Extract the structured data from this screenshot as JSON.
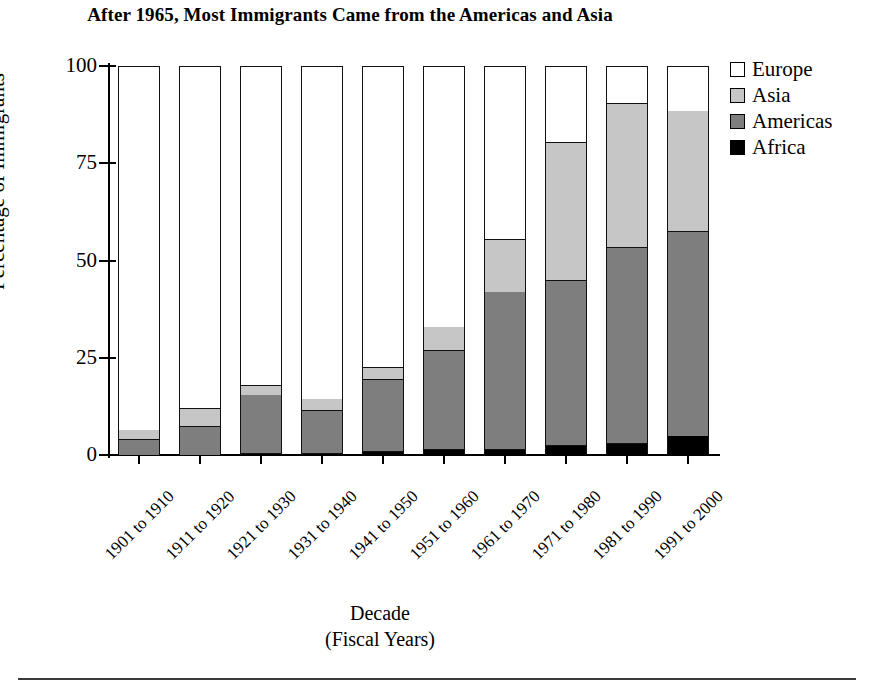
{
  "title": "After 1965, Most Immigrants Came from the Americas and Asia",
  "axis": {
    "ylabel": "Percentage of Immigrants",
    "xlabel_line1": "Decade",
    "xlabel_line2": "(Fiscal Years)",
    "yticks": [
      "100",
      "75",
      "50",
      "25",
      "0"
    ]
  },
  "legend": {
    "items": [
      {
        "label": "Europe",
        "color": "#ffffff"
      },
      {
        "label": "Asia",
        "color": "#c6c6c6"
      },
      {
        "label": "Americas",
        "color": "#7e7e7e"
      },
      {
        "label": "Africa",
        "color": "#000000"
      }
    ]
  },
  "chart_data": {
    "type": "bar",
    "subtype": "stacked-vertical",
    "title": "After 1965, Most Immigrants Came from the Americas and Asia",
    "xlabel": "Decade (Fiscal Years)",
    "ylabel": "Percentage of Immigrants",
    "ylim": [
      0,
      100
    ],
    "yticks": [
      0,
      25,
      50,
      75,
      100
    ],
    "grid": false,
    "legend_position": "top-right",
    "categories": [
      "1901 to 1910",
      "1911 to 1920",
      "1921 to 1930",
      "1931 to 1940",
      "1941 to 1950",
      "1951 to 1960",
      "1961 to 1970",
      "1971 to 1980",
      "1981 to 1990",
      "1991 to 2000"
    ],
    "stack_order_bottom_to_top": [
      "Africa",
      "Americas",
      "Asia",
      "Europe"
    ],
    "series": [
      {
        "name": "Africa",
        "color": "#000000",
        "values": [
          0,
          0,
          0.5,
          0.5,
          1,
          1.5,
          1.5,
          2.5,
          3,
          5
        ]
      },
      {
        "name": "Americas",
        "color": "#7e7e7e",
        "values": [
          4,
          7.5,
          15,
          11,
          18.5,
          25.5,
          40.5,
          42.5,
          50.5,
          52.5
        ]
      },
      {
        "name": "Asia",
        "color": "#c6c6c6",
        "values": [
          2.5,
          4.5,
          2.5,
          3,
          3,
          6,
          13.5,
          35.5,
          37,
          31
        ]
      },
      {
        "name": "Europe",
        "color": "#ffffff",
        "values": [
          93.5,
          88,
          82,
          85.5,
          77.5,
          67,
          44.5,
          19.5,
          9.5,
          11.5
        ]
      }
    ],
    "cumulative_tops": {
      "Africa": [
        0,
        0,
        0.5,
        0.5,
        1,
        1.5,
        1.5,
        2.5,
        3,
        5
      ],
      "Americas": [
        4,
        7.5,
        15.5,
        11.5,
        19.5,
        27,
        42,
        45,
        53.5,
        57.5
      ],
      "Asia": [
        6.5,
        12,
        18,
        14.5,
        22.5,
        33,
        55.5,
        80.5,
        90.5,
        88.5
      ],
      "Europe": [
        100,
        100,
        100,
        100,
        100,
        100,
        100,
        100,
        100,
        100
      ]
    }
  }
}
